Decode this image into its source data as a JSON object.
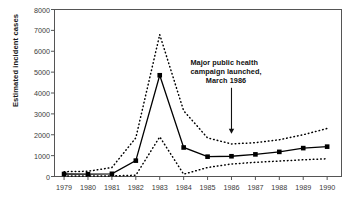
{
  "chart_data": {
    "type": "line",
    "title": "",
    "xlabel": "",
    "ylabel": "Estimated incident cases",
    "categories": [
      "1979",
      "1980",
      "1981",
      "1982",
      "1983",
      "1984",
      "1985",
      "1986",
      "1987",
      "1988",
      "1989",
      "1990"
    ],
    "x": [
      1979,
      1980,
      1981,
      1982,
      1983,
      1984,
      1985,
      1986,
      1987,
      1988,
      1989,
      1990
    ],
    "xlim": [
      1978.6,
      1990.6
    ],
    "ylim": [
      0,
      8000
    ],
    "yticks": [
      0,
      1000,
      2000,
      3000,
      4000,
      5000,
      6000,
      7000,
      8000
    ],
    "ytick_labels": [
      "0",
      "1000",
      "2000",
      "3000",
      "4000",
      "5000",
      "6000",
      "7000",
      "8000"
    ],
    "grid": false,
    "legend": "none",
    "series": [
      {
        "name": "Estimated incident cases",
        "style": "solid-with-square-markers",
        "color": "#000000",
        "values": [
          120,
          110,
          130,
          760,
          4850,
          1390,
          950,
          970,
          1060,
          1180,
          1360,
          1430
        ]
      },
      {
        "name": "Upper uncertainty bound",
        "style": "dotted",
        "color": "#000000",
        "values": [
          230,
          250,
          430,
          1850,
          6800,
          3150,
          1850,
          1560,
          1620,
          1760,
          2000,
          2300
        ]
      },
      {
        "name": "Lower uncertainty bound",
        "style": "dotted",
        "color": "#000000",
        "values": [
          20,
          20,
          30,
          60,
          1900,
          110,
          430,
          600,
          680,
          740,
          800,
          850
        ]
      }
    ],
    "annotations": [
      {
        "name": "campaign-annotation",
        "line1": "Major public health",
        "line2": "campaign launched,",
        "line3": "March 1986",
        "arrow_target_x": 1986,
        "arrow_target_y": 2050
      }
    ]
  }
}
